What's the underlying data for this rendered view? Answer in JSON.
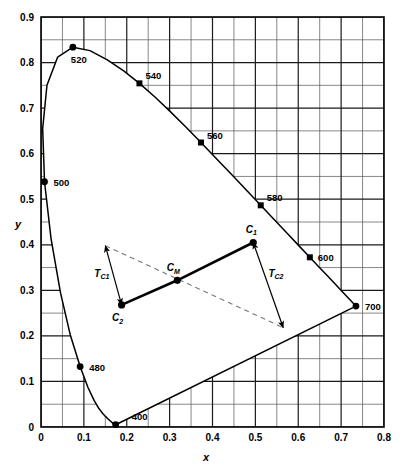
{
  "chart_data": {
    "type": "scatter",
    "title": "",
    "xlabel": "x",
    "ylabel": "y",
    "xlim": [
      0,
      0.8
    ],
    "ylim": [
      0,
      0.9
    ],
    "grid": true,
    "grid_step": 0.05,
    "x_ticks": [
      "0",
      "0.1",
      "0.2",
      "0.3",
      "0.4",
      "0.5",
      "0.6",
      "0.7",
      "0.8"
    ],
    "x_tick_values": [
      0,
      0.1,
      0.2,
      0.3,
      0.4,
      0.5,
      0.6,
      0.7,
      0.8
    ],
    "y_ticks": [
      "0",
      "0.1",
      "0.2",
      "0.3",
      "0.4",
      "0.5",
      "0.6",
      "0.7",
      "0.8",
      "0.9"
    ],
    "y_tick_values": [
      0,
      0.1,
      0.2,
      0.3,
      0.4,
      0.5,
      0.6,
      0.7,
      0.8,
      0.9
    ],
    "legend_position": "none",
    "spectral_locus": {
      "name": "CIE 1931 spectral locus",
      "closed": true,
      "points": [
        [
          0.1741,
          0.005
        ],
        [
          0.174,
          0.005
        ],
        [
          0.1738,
          0.0049
        ],
        [
          0.1736,
          0.0049
        ],
        [
          0.1733,
          0.0048
        ],
        [
          0.173,
          0.0048
        ],
        [
          0.1726,
          0.0048
        ],
        [
          0.1721,
          0.0048
        ],
        [
          0.1714,
          0.0051
        ],
        [
          0.1703,
          0.0058
        ],
        [
          0.1689,
          0.0069
        ],
        [
          0.1669,
          0.0086
        ],
        [
          0.1644,
          0.0109
        ],
        [
          0.1611,
          0.0138
        ],
        [
          0.1566,
          0.0177
        ],
        [
          0.151,
          0.0227
        ],
        [
          0.144,
          0.0297
        ],
        [
          0.1355,
          0.0399
        ],
        [
          0.1241,
          0.0578
        ],
        [
          0.1096,
          0.0868
        ],
        [
          0.0913,
          0.1327
        ],
        [
          0.0687,
          0.2007
        ],
        [
          0.0454,
          0.295
        ],
        [
          0.0235,
          0.4127
        ],
        [
          0.0082,
          0.5384
        ],
        [
          0.0039,
          0.6548
        ],
        [
          0.0139,
          0.7502
        ],
        [
          0.0389,
          0.812
        ],
        [
          0.0743,
          0.8338
        ],
        [
          0.1142,
          0.8262
        ],
        [
          0.1547,
          0.8059
        ],
        [
          0.1929,
          0.7816
        ],
        [
          0.2296,
          0.7543
        ],
        [
          0.2658,
          0.7243
        ],
        [
          0.3016,
          0.6923
        ],
        [
          0.3373,
          0.6589
        ],
        [
          0.3731,
          0.6245
        ],
        [
          0.4087,
          0.5896
        ],
        [
          0.4441,
          0.5547
        ],
        [
          0.4788,
          0.5202
        ],
        [
          0.5125,
          0.4866
        ],
        [
          0.5448,
          0.4544
        ],
        [
          0.5752,
          0.4242
        ],
        [
          0.6029,
          0.3965
        ],
        [
          0.627,
          0.3725
        ],
        [
          0.6482,
          0.3514
        ],
        [
          0.6658,
          0.334
        ],
        [
          0.6801,
          0.3197
        ],
        [
          0.6915,
          0.3083
        ],
        [
          0.7006,
          0.2993
        ],
        [
          0.7079,
          0.292
        ],
        [
          0.714,
          0.2859
        ],
        [
          0.719,
          0.2809
        ],
        [
          0.723,
          0.277
        ],
        [
          0.726,
          0.274
        ],
        [
          0.7283,
          0.2717
        ],
        [
          0.73,
          0.27
        ],
        [
          0.7311,
          0.2689
        ],
        [
          0.732,
          0.268
        ],
        [
          0.7327,
          0.2673
        ],
        [
          0.7334,
          0.2666
        ],
        [
          0.734,
          0.266
        ],
        [
          0.7344,
          0.2656
        ],
        [
          0.7346,
          0.2654
        ]
      ]
    },
    "wavelength_markers": [
      {
        "label": "400",
        "x": 0.1741,
        "y": 0.005,
        "label_dx": 16,
        "label_dy": -5,
        "marker": "circle"
      },
      {
        "label": "480",
        "x": 0.0913,
        "y": 0.1327,
        "label_dx": 9,
        "label_dy": 4,
        "marker": "circle"
      },
      {
        "label": "500",
        "x": 0.0082,
        "y": 0.5384,
        "label_dx": 9,
        "label_dy": 4,
        "marker": "circle"
      },
      {
        "label": "520",
        "x": 0.0743,
        "y": 0.8338,
        "label_dx": -2,
        "label_dy": 16,
        "marker": "circle"
      },
      {
        "label": "540",
        "x": 0.2296,
        "y": 0.7543,
        "label_dx": 6,
        "label_dy": -4,
        "marker": "square"
      },
      {
        "label": "560",
        "x": 0.3731,
        "y": 0.6245,
        "label_dx": 6,
        "label_dy": -4,
        "marker": "square"
      },
      {
        "label": "580",
        "x": 0.5125,
        "y": 0.4866,
        "label_dx": 6,
        "label_dy": -4,
        "marker": "square"
      },
      {
        "label": "600",
        "x": 0.627,
        "y": 0.3725,
        "label_dx": 8,
        "label_dy": 4,
        "marker": "square"
      },
      {
        "label": "700",
        "x": 0.7346,
        "y": 0.2654,
        "label_dx": 9,
        "label_dy": 4,
        "marker": "circle"
      }
    ],
    "chromaticity_points": [
      {
        "id": "C1",
        "label": "C",
        "subscript": "1",
        "x": 0.495,
        "y": 0.405,
        "label_dx": -2,
        "label_dy": -10
      },
      {
        "id": "CM",
        "label": "C",
        "subscript": "M",
        "x": 0.318,
        "y": 0.322,
        "label_dx": -4,
        "label_dy": -9
      },
      {
        "id": "C2",
        "label": "C",
        "subscript": "2",
        "x": 0.188,
        "y": 0.268,
        "label_dx": -4,
        "label_dy": 16
      }
    ],
    "mixing_line": {
      "name": "mixing-line-c1-c2",
      "from": [
        0.495,
        0.405
      ],
      "to": [
        0.188,
        0.268
      ],
      "style": "solid-thick"
    },
    "dashed_line": {
      "name": "dominant-wavelength-dashed-line",
      "from": [
        0.15,
        0.398
      ],
      "to": [
        0.565,
        0.218
      ],
      "style": "dashed"
    },
    "transition_vectors": [
      {
        "id": "Tc1",
        "label": "T",
        "subscript": "C1",
        "from": [
          0.188,
          0.268
        ],
        "to": [
          0.15,
          0.398
        ],
        "arrow_start": true,
        "arrow_end": true,
        "label_x": 0.142,
        "label_y": 0.33
      },
      {
        "id": "Tc2",
        "label": "T",
        "subscript": "C2",
        "from": [
          0.495,
          0.405
        ],
        "to": [
          0.565,
          0.218
        ],
        "arrow_start": true,
        "arrow_end": true,
        "label_x": 0.548,
        "label_y": 0.33
      }
    ],
    "colors": {
      "curve": "#000000",
      "grid_major": "#1a1a1a",
      "grid_minor": "#555555",
      "axis": "#000000",
      "dashed": "#777777",
      "marker": "#000000",
      "background": "#ffffff"
    }
  }
}
